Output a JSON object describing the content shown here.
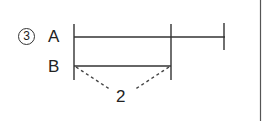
{
  "problem": {
    "number_label": "3",
    "number_style": "circled"
  },
  "labels": {
    "a": "A",
    "b": "B",
    "difference": "2"
  },
  "segments": {
    "a": {
      "name": "A",
      "start_x": 74,
      "end_x": 224,
      "y": 37
    },
    "b": {
      "name": "B",
      "start_x": 74,
      "end_x": 171,
      "y": 66
    }
  },
  "colors": {
    "line": "#333333",
    "text": "#222222",
    "background": "#ffffff"
  }
}
